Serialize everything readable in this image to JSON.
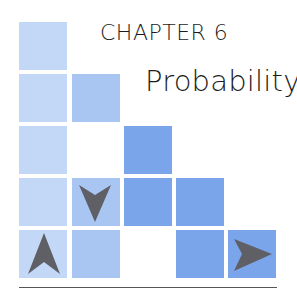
{
  "chapter": {
    "label": "CHAPTER 6",
    "title": "Probability"
  },
  "colors": {
    "light_blue": "#c3d8f6",
    "medium_blue": "#a9c6f2",
    "dark_blue": "#7ba5ea",
    "arrow_gray": "#5f5f66",
    "text": "#1c1c1c"
  },
  "decoration": {
    "grid_squares": [
      {
        "row": 1,
        "col": 1,
        "shade": "light"
      },
      {
        "row": 2,
        "col": 1,
        "shade": "light"
      },
      {
        "row": 2,
        "col": 2,
        "shade": "medium"
      },
      {
        "row": 3,
        "col": 1,
        "shade": "light"
      },
      {
        "row": 3,
        "col": 3,
        "shade": "dark"
      },
      {
        "row": 4,
        "col": 1,
        "shade": "light"
      },
      {
        "row": 4,
        "col": 2,
        "shade": "medium",
        "icon": "arrow-down-icon"
      },
      {
        "row": 4,
        "col": 3,
        "shade": "dark"
      },
      {
        "row": 4,
        "col": 4,
        "shade": "dark"
      },
      {
        "row": 5,
        "col": 1,
        "shade": "light",
        "icon": "arrow-up-icon"
      },
      {
        "row": 5,
        "col": 2,
        "shade": "medium"
      },
      {
        "row": 5,
        "col": 4,
        "shade": "dark"
      },
      {
        "row": 5,
        "col": 5,
        "shade": "dark",
        "icon": "arrow-right-icon"
      }
    ]
  }
}
